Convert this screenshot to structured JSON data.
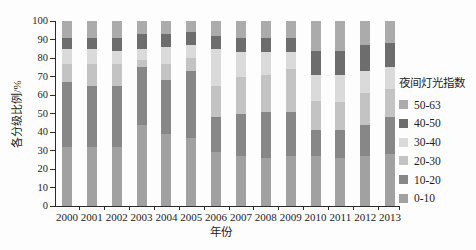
{
  "figure": {
    "y_axis_title": "各分级比例/%",
    "x_axis_title": "年份",
    "legend_title": "夜间灯光指数",
    "background": "#fdfdfd",
    "axis_color": "#2b2b2b",
    "y_tick_labels": [
      "0",
      "10",
      "20",
      "30",
      "40",
      "50",
      "60",
      "70",
      "80",
      "90",
      "100"
    ]
  },
  "chart_data": {
    "type": "bar",
    "stacked": true,
    "unit": "percent",
    "title": "",
    "xlabel": "年份",
    "ylabel": "各分级比例/%",
    "ylim": [
      0,
      100
    ],
    "y_tick_step": 10,
    "grid": false,
    "legend_position": "right",
    "legend_title": "夜间灯光指数",
    "categories": [
      "2000",
      "2001",
      "2002",
      "2003",
      "2004",
      "2005",
      "2006",
      "2007",
      "2008",
      "2009",
      "2010",
      "2011",
      "2012",
      "2013"
    ],
    "series_bottom_to_top": [
      {
        "name": "0-10",
        "color": "#a1a1a1",
        "values": [
          32,
          32,
          32,
          44,
          39,
          37,
          29,
          27,
          26,
          27,
          27,
          26,
          27,
          28
        ]
      },
      {
        "name": "10-20",
        "color": "#878787",
        "values": [
          35,
          33,
          33,
          31,
          29,
          36,
          19,
          23,
          25,
          24,
          14,
          15,
          17,
          20
        ]
      },
      {
        "name": "20-30",
        "color": "#c3c3c3",
        "values": [
          10,
          12,
          12,
          4,
          9,
          7,
          17,
          20,
          20,
          23,
          16,
          15,
          17,
          15
        ]
      },
      {
        "name": "30-40",
        "color": "#dadada",
        "values": [
          8,
          8,
          7,
          6,
          9,
          7,
          20,
          13,
          12,
          9,
          14,
          15,
          12,
          12
        ]
      },
      {
        "name": "40-50",
        "color": "#6d6d6d",
        "values": [
          6,
          6,
          7,
          8,
          7,
          7,
          7,
          8,
          8,
          8,
          13,
          13,
          14,
          13
        ]
      },
      {
        "name": "50-63",
        "color": "#ababab",
        "values": [
          9,
          9,
          9,
          7,
          7,
          6,
          8,
          9,
          9,
          9,
          16,
          16,
          13,
          12
        ]
      }
    ],
    "legend_order_top_to_bottom": [
      "50-63",
      "40-50",
      "30-40",
      "20-30",
      "10-20",
      "0-10"
    ]
  }
}
